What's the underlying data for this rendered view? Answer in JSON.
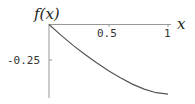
{
  "chart_data": {
    "type": "line",
    "title": "",
    "xlabel": "x",
    "ylabel": "f(x)",
    "xlim": [
      0,
      1.05
    ],
    "ylim": [
      -0.52,
      0
    ],
    "grid": false,
    "legend": null,
    "x_ticks": [
      0.5,
      1
    ],
    "x_tick_labels": [
      "0.5",
      "1"
    ],
    "y_ticks": [
      -0.25
    ],
    "y_tick_labels": [
      "-0.25"
    ],
    "series": [
      {
        "name": "f(x)",
        "color": "#555555",
        "x": [
          0,
          0.1,
          0.2,
          0.3,
          0.4,
          0.5,
          0.6,
          0.7,
          0.8,
          0.9,
          1.0
        ],
        "y": [
          0,
          -0.075,
          -0.145,
          -0.21,
          -0.27,
          -0.325,
          -0.375,
          -0.42,
          -0.455,
          -0.48,
          -0.49
        ]
      }
    ]
  },
  "labels": {
    "y_axis": "f(x)",
    "x_axis": "x",
    "tick_x_half": "0.5",
    "tick_x_one": "1",
    "tick_y_quarter": "-0.25"
  }
}
